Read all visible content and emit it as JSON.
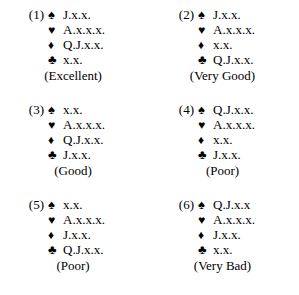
{
  "page": {
    "background_color": "#ffffff",
    "text_color": "#000000"
  },
  "suit_glyphs": {
    "spade": "♠",
    "heart": "♥",
    "diamond": "♦",
    "club": "♣"
  },
  "hands": [
    {
      "number": "(1)",
      "rating": "(Excellent)",
      "suits": [
        {
          "name": "spades",
          "glyph": "♠",
          "holding": "J.x.x."
        },
        {
          "name": "hearts",
          "glyph": "♥",
          "holding": "A.x.x.x."
        },
        {
          "name": "diamonds",
          "glyph": "♦",
          "holding": "Q.J.x.x."
        },
        {
          "name": "clubs",
          "glyph": "♣",
          "holding": "x.x."
        }
      ]
    },
    {
      "number": "(2)",
      "rating": "(Very Good)",
      "suits": [
        {
          "name": "spades",
          "glyph": "♠",
          "holding": "J.x.x."
        },
        {
          "name": "hearts",
          "glyph": "♥",
          "holding": "A.x.x.x."
        },
        {
          "name": "diamonds",
          "glyph": "♦",
          "holding": "x.x."
        },
        {
          "name": "clubs",
          "glyph": "♣",
          "holding": "Q.J.x.x."
        }
      ]
    },
    {
      "number": "(3)",
      "rating": "(Good)",
      "suits": [
        {
          "name": "spades",
          "glyph": "♠",
          "holding": "x.x."
        },
        {
          "name": "hearts",
          "glyph": "♥",
          "holding": "A.x.x.x."
        },
        {
          "name": "diamonds",
          "glyph": "♦",
          "holding": "Q.J.x.x."
        },
        {
          "name": "clubs",
          "glyph": "♣",
          "holding": "J.x.x."
        }
      ]
    },
    {
      "number": "(4)",
      "rating": "(Poor)",
      "suits": [
        {
          "name": "spades",
          "glyph": "♠",
          "holding": "Q.J.x.x."
        },
        {
          "name": "hearts",
          "glyph": "♥",
          "holding": "A.x.x.x."
        },
        {
          "name": "diamonds",
          "glyph": "♦",
          "holding": "x.x."
        },
        {
          "name": "clubs",
          "glyph": "♣",
          "holding": "J.x.x."
        }
      ]
    },
    {
      "number": "(5)",
      "rating": "(Poor)",
      "suits": [
        {
          "name": "spades",
          "glyph": "♠",
          "holding": "x.x."
        },
        {
          "name": "hearts",
          "glyph": "♥",
          "holding": "A.x.x.x."
        },
        {
          "name": "diamonds",
          "glyph": "♦",
          "holding": "J.x.x."
        },
        {
          "name": "clubs",
          "glyph": "♣",
          "holding": "Q.J.x.x."
        }
      ]
    },
    {
      "number": "(6)",
      "rating": "(Very Bad)",
      "suits": [
        {
          "name": "spades",
          "glyph": "♠",
          "holding": "Q.J.x.x"
        },
        {
          "name": "hearts",
          "glyph": "♥",
          "holding": "A.x.x.x."
        },
        {
          "name": "diamonds",
          "glyph": "♦",
          "holding": "J.x.x."
        },
        {
          "name": "clubs",
          "glyph": "♣",
          "holding": "x.x."
        }
      ]
    }
  ]
}
